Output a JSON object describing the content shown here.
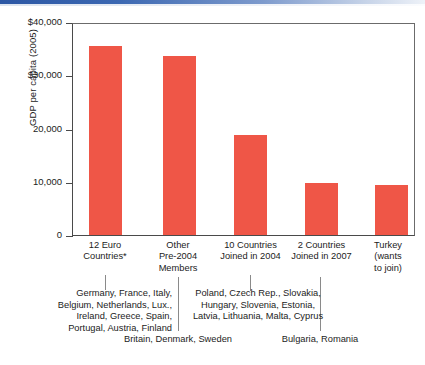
{
  "chart_data": {
    "type": "bar",
    "title": "",
    "subtitle": "",
    "xlabel": "",
    "ylabel": "GDP per capita (2005)",
    "ylim": [
      0,
      40000
    ],
    "yticks": [
      "$40,000",
      "$30,000",
      "20,000",
      "10,000",
      "0"
    ],
    "ytick_values": [
      40000,
      30000,
      20000,
      10000,
      0
    ],
    "grid": false,
    "legend": "none",
    "bar_color": "#ef5647",
    "categories": [
      "12 Euro\nCountries*",
      "Other\nPre-2004\nMembers",
      "10 Countries\nJoined in 2004",
      "2 Countries\nJoined in 2007",
      "Turkey\n(wants\nto join)"
    ],
    "values": [
      35800,
      34000,
      19000,
      9900,
      9400
    ],
    "annotations": [
      {
        "group": "12 Euro Countries*",
        "text": "Germany, France, Italy,\nBelgium, Netherlands, Lux.,\nIreland, Greece, Spain,\nPortugal, Austria, Finland"
      },
      {
        "group": "Other Pre-2004 Members",
        "text": "Britain, Denmark, Sweden"
      },
      {
        "group": "10 Countries Joined in 2004",
        "text": "Poland, Czech Rep., Slovakia,\nHungary, Slovenia, Estonia,\nLatvia, Lithuania, Malta, Cyprus"
      },
      {
        "group": "2 Countries Joined in 2007",
        "text": "Bulgaria, Romania"
      }
    ]
  },
  "axis": {
    "y_title": "GDP per capita (2005)",
    "ticks": [
      {
        "label": "$40,000"
      },
      {
        "label": "$30,000"
      },
      {
        "label": "20,000"
      },
      {
        "label": "10,000"
      },
      {
        "label": "0"
      }
    ]
  },
  "categories": [
    {
      "label": "12 Euro\nCountries*"
    },
    {
      "label": "Other\nPre-2004\nMembers"
    },
    {
      "label": "10 Countries\nJoined in 2004"
    },
    {
      "label": "2 Countries\nJoined in 2007"
    },
    {
      "label": "Turkey\n(wants\nto join)"
    }
  ],
  "details": {
    "euro12": "Germany, France, Italy,\nBelgium, Netherlands, Lux.,\nIreland, Greece, Spain,\nPortugal, Austria, Finland",
    "pre2004": "Britain, Denmark, Sweden",
    "joined2004": "Poland, Czech Rep., Slovakia,\nHungary, Slovenia, Estonia,\nLatvia, Lithuania, Malta, Cyprus",
    "joined2007": "Bulgaria, Romania"
  },
  "colors": {
    "bar": "#ef5647",
    "rule": "#2c57a4",
    "axis": "#4a4a4a",
    "text": "#1c1c1c"
  }
}
